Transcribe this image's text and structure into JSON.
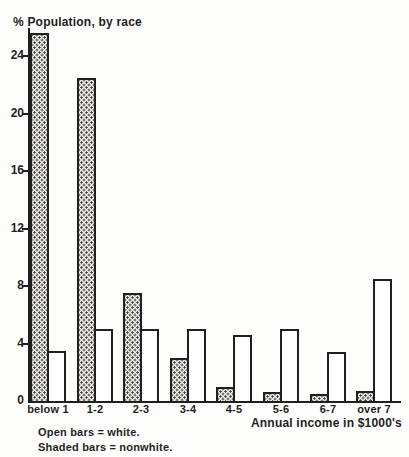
{
  "figure": {
    "title": "% Population, by race",
    "x_axis_label": "Annual income in $1000's",
    "legend": {
      "open_bars": "Open bars = white.",
      "shaded_bars": "Shaded bars = nonwhite."
    }
  },
  "chart_data": {
    "type": "bar",
    "title": "% Population, by race",
    "xlabel": "Annual income in $1000's",
    "ylabel": "% Population, by race",
    "categories": [
      "below 1",
      "1-2",
      "2-3",
      "3-4",
      "4-5",
      "5-6",
      "6-7",
      "over 7"
    ],
    "series": [
      {
        "name": "nonwhite",
        "bar_style": "shaded",
        "values": [
          25.6,
          22.5,
          7.5,
          3.0,
          1.0,
          0.6,
          0.5,
          0.7
        ]
      },
      {
        "name": "white",
        "bar_style": "open",
        "values": [
          3.5,
          5.0,
          5.0,
          5.0,
          4.6,
          5.0,
          3.4,
          8.5
        ]
      }
    ],
    "yticks": [
      0,
      4,
      8,
      12,
      16,
      20,
      24
    ],
    "ylim": [
      0,
      26
    ],
    "grid": false,
    "legend": [
      "Open bars = white.",
      "Shaded bars = nonwhite."
    ],
    "legend_position": "below-left"
  },
  "colors": {
    "ink": "#1f1f1f",
    "paper": "#fdfdfb",
    "shaded_bg": "#f1eee8",
    "shaded_dot": "#3a3a3a"
  }
}
